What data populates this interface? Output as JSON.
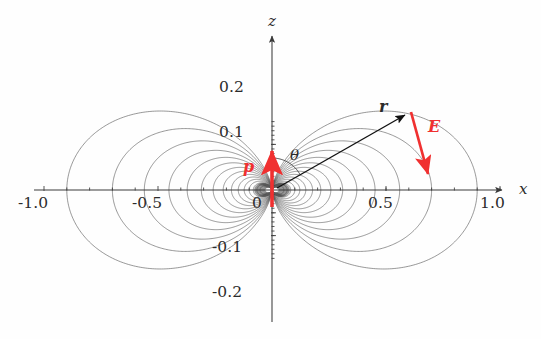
{
  "figure": {
    "kind": "electric-dipole-field-line-diagram",
    "background_color": "#fefefe",
    "curve_color": "#555555",
    "axis_color": "#3a3a3a",
    "accent_color": "#f03030",
    "text_color": "#2b2b2b"
  },
  "axes": {
    "x": {
      "name": "x",
      "name_pos": {
        "x": 519,
        "y": 182
      },
      "tick_labels": [
        "-1.0",
        "-0.5",
        "0",
        "0.5",
        "1.0"
      ],
      "tick_values": [
        -1.0,
        -0.5,
        0,
        0.5,
        1.0
      ],
      "range": [
        -1.15,
        1.15
      ],
      "minor_ticks_per_interval": 5
    },
    "z": {
      "name": "z",
      "name_pos": {
        "x": 272,
        "y": 22
      },
      "tick_labels": [
        "0.2",
        "0.1",
        "-0.1",
        "-0.2"
      ],
      "tick_values": [
        0.2,
        0.1,
        -0.1,
        -0.2
      ],
      "range": [
        -0.33,
        0.33
      ],
      "minor_ticks_per_interval": 5
    },
    "origin_px": {
      "x": 272,
      "y": 190
    },
    "scale_px_per_unit_x": 228,
    "scale_px_per_unit_z": 228
  },
  "tick_label_positions": {
    "x_minus_1_0": {
      "text": "-1.0",
      "x": 18,
      "y": 196
    },
    "x_minus_0_5": {
      "text": "-0.5",
      "x": 132,
      "y": 196
    },
    "x_zero": {
      "text": "0",
      "x": 252,
      "y": 196
    },
    "x_plus_0_5": {
      "text": "0.5",
      "x": 368,
      "y": 196
    },
    "x_plus_1_0": {
      "text": "1.0",
      "x": 480,
      "y": 196
    },
    "z_plus_0_2": {
      "text": "0.2",
      "x": 219,
      "y": 80
    },
    "z_plus_0_1": {
      "text": "0.1",
      "x": 219,
      "y": 125
    },
    "z_minus_0_1": {
      "text": "-0.1",
      "x": 212,
      "y": 240
    },
    "z_minus_0_2": {
      "text": "-0.2",
      "x": 212,
      "y": 285
    }
  },
  "vectors": {
    "p": {
      "label": "p",
      "label_pos": {
        "x": 243,
        "y": 160
      },
      "color": "#f03030",
      "description": "dipole moment, vertical red arrow at origin pointing up (+z)",
      "tail_px": {
        "x": 272,
        "y": 207
      },
      "head_px": {
        "x": 272,
        "y": 151
      }
    },
    "r": {
      "label": "r",
      "label_pos": {
        "x": 380,
        "y": 101
      },
      "color": "#111111",
      "description": "position vector from origin to field point, black arrow",
      "tail_px": {
        "x": 277,
        "y": 188
      },
      "head_px": {
        "x": 405,
        "y": 115
      },
      "angle_deg_from_z": 60
    },
    "E": {
      "label": "E",
      "label_pos": {
        "x": 428,
        "y": 122
      },
      "color": "#f03030",
      "description": "electric field at the field point, red arrow pointing down-right",
      "tail_px": {
        "x": 411,
        "y": 112
      },
      "head_px": {
        "x": 428,
        "y": 174
      }
    }
  },
  "angle": {
    "label": "θ",
    "label_pos": {
      "x": 291,
      "y": 150
    },
    "description": "polar angle between dipole axis (p, +z) and position vector r",
    "arc_radius_px": 32,
    "arc_from_deg": 0,
    "arc_to_deg": 60
  },
  "chart_data": {
    "type": "line",
    "title": "",
    "xlabel": "x",
    "ylabel": "z",
    "xlim": [
      -1.15,
      1.15
    ],
    "ylim": [
      -0.33,
      0.33
    ],
    "grid": false,
    "legend": null,
    "field_model": "ideal electric dipole; field lines r(θ) = r0 · sin^2(θ)",
    "loop_r0_values": [
      0.052,
      0.066,
      0.082,
      0.1,
      0.122,
      0.148,
      0.178,
      0.214,
      0.258,
      0.31,
      0.372,
      0.452,
      0.56,
      0.7,
      0.9
    ],
    "quadrants": [
      "+x+z",
      "-x+z",
      "+x-z",
      "-x-z"
    ],
    "annotations": [
      {
        "text": "p",
        "kind": "vector",
        "color": "#f03030"
      },
      {
        "text": "r",
        "kind": "vector",
        "color": "#111111"
      },
      {
        "text": "E",
        "kind": "vector",
        "color": "#f03030"
      },
      {
        "text": "θ",
        "kind": "angle",
        "color": "#2b2b2b"
      }
    ]
  }
}
